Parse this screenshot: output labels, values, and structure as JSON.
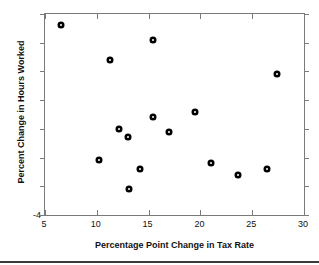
{
  "chart_data": {
    "type": "scatter",
    "title": "",
    "xlabel": "Percentage Point Change in Tax Rate",
    "ylabel": "Percent Change in Hours Worked",
    "xlim": [
      5,
      30
    ],
    "ylim": [
      -4,
      3
    ],
    "grid": false,
    "legend": null,
    "xticks": [
      5,
      10,
      15,
      20,
      25,
      30
    ],
    "xticklabels": [
      "5",
      "10",
      "15",
      "20",
      "25",
      "30"
    ],
    "yticks": [
      -4,
      -3,
      -2,
      -1,
      0,
      1,
      2,
      3
    ],
    "yticklabels": [
      "-4",
      "",
      "",
      "",
      "",
      "",
      "",
      ""
    ],
    "marker": "filled-circle",
    "marker_color": "#000000",
    "points": [
      {
        "x": 6.5,
        "y": 2.6
      },
      {
        "x": 15.4,
        "y": 2.1
      },
      {
        "x": 11.3,
        "y": 1.4
      },
      {
        "x": 27.4,
        "y": 0.9
      },
      {
        "x": 15.4,
        "y": -0.6
      },
      {
        "x": 19.5,
        "y": -0.4
      },
      {
        "x": 12.1,
        "y": -1.0
      },
      {
        "x": 17.0,
        "y": -1.1
      },
      {
        "x": 13.0,
        "y": -1.3
      },
      {
        "x": 10.2,
        "y": -2.1
      },
      {
        "x": 14.2,
        "y": -2.4
      },
      {
        "x": 21.0,
        "y": -2.2
      },
      {
        "x": 26.4,
        "y": -2.4
      },
      {
        "x": 23.6,
        "y": -2.6
      },
      {
        "x": 13.1,
        "y": -3.1
      }
    ]
  },
  "axes": {
    "y_origin_label": "-4"
  }
}
